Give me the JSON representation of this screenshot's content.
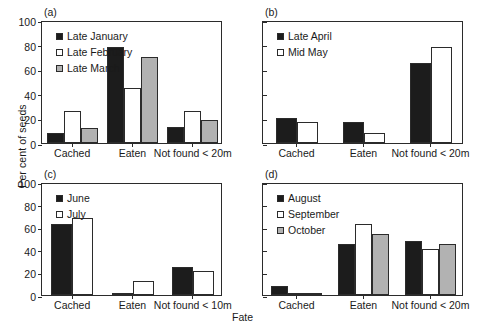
{
  "chart_data": {
    "type": "bar",
    "title": "",
    "xlabel": "Fate",
    "ylabel": "Per cent of seeds",
    "ylim": [
      0,
      100
    ],
    "yticks": [
      0,
      20,
      40,
      60,
      80,
      100
    ],
    "grid": false,
    "legend_position": "upper-left inside each panel",
    "panels": [
      {
        "tag": "(a)",
        "categories": [
          "Cached",
          "Eaten",
          "Not found < 20m"
        ],
        "series": [
          {
            "name": "Late January",
            "color": "#1c1c1c",
            "values": [
              8,
              78,
              13
            ]
          },
          {
            "name": "Late February",
            "color": "#ffffff",
            "values": [
              26,
              45,
              26
            ]
          },
          {
            "name": "Late March",
            "color": "#b2b2b2",
            "values": [
              12,
              70,
              19
            ]
          }
        ],
        "yticklabels": [
          "0",
          "20",
          "40",
          "60",
          "80",
          "100"
        ]
      },
      {
        "tag": "(b)",
        "categories": [
          "Cached",
          "Eaten",
          "Not found < 20m"
        ],
        "series": [
          {
            "name": "Late April",
            "color": "#1c1c1c",
            "values": [
              20,
              17,
              65
            ]
          },
          {
            "name": "Mid May",
            "color": "#ffffff",
            "values": [
              17,
              8,
              78
            ]
          }
        ],
        "yticklabels": [
          "",
          "",
          "",
          "",
          "",
          ""
        ]
      },
      {
        "tag": "(c)",
        "categories": [
          "Cached",
          "Eaten",
          "Not found < 10m"
        ],
        "series": [
          {
            "name": "June",
            "color": "#1c1c1c",
            "values": [
              63,
              1,
              25
            ]
          },
          {
            "name": "July",
            "color": "#ffffff",
            "values": [
              68,
              12,
              21
            ]
          }
        ],
        "yticklabels": [
          "0",
          "20",
          "40",
          "60",
          "80",
          "100"
        ]
      },
      {
        "tag": "(d)",
        "categories": [
          "Cached",
          "Eaten",
          "Not found < 20m"
        ],
        "series": [
          {
            "name": "August",
            "color": "#1c1c1c",
            "values": [
              8,
              45,
              48
            ]
          },
          {
            "name": "September",
            "color": "#ffffff",
            "values": [
              1,
              63,
              41
            ]
          },
          {
            "name": "October",
            "color": "#b2b2b2",
            "values": [
              0,
              54,
              45
            ]
          }
        ],
        "yticklabels": [
          "",
          "",
          "",
          "",
          "",
          ""
        ]
      }
    ]
  },
  "axes": {
    "ylabel": "Per cent of seeds",
    "xlabel": "Fate"
  }
}
